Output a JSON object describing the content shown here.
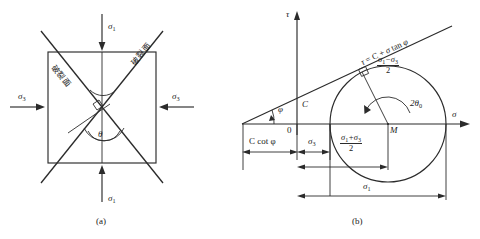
{
  "figure": {
    "title_a": "(a)",
    "title_b": "(b)",
    "panel_a": {
      "stress_top": "σ",
      "stress_top_sub": "1",
      "stress_bottom": "σ",
      "stress_bottom_sub": "1",
      "stress_left": "σ",
      "stress_left_sub": "3",
      "stress_right": "σ",
      "stress_right_sub": "3",
      "angle_label": "θ",
      "failure_plane_left": "破裂面",
      "failure_plane_right": "破裂面"
    },
    "panel_b": {
      "axis_y": "τ",
      "axis_x": "σ",
      "origin": "0",
      "cohesion_intercept": "C",
      "friction_angle": "φ",
      "envelope_equation": "τ = C + σ tan φ",
      "envelope_equation_parts": {
        "tau": "τ",
        "equals": "=",
        "c": "C",
        "plus": "+",
        "sigma": "σ",
        "tan": "tan",
        "phi": "φ"
      },
      "c_cot_phi": "C cot φ",
      "sigma3": "σ",
      "sigma3_sub": "3",
      "sigma1": "σ",
      "sigma1_sub": "1",
      "center_point": "M",
      "double_theta": "2θ",
      "double_theta_sub": "0",
      "radius_numerator": "σ₁ − σ₃",
      "radius_num_a": "σ",
      "radius_num_a_sub": "1",
      "radius_num_minus": "−",
      "radius_num_b": "σ",
      "radius_num_b_sub": "3",
      "radius_denominator": "2",
      "center_numerator": "σ₁ + σ₃",
      "center_num_a": "σ",
      "center_num_a_sub": "1",
      "center_num_plus": "+",
      "center_num_b": "σ",
      "center_num_b_sub": "3",
      "center_denominator": "2"
    },
    "colors": {
      "ink": "#2b2b2b",
      "background": "#ffffff"
    }
  }
}
